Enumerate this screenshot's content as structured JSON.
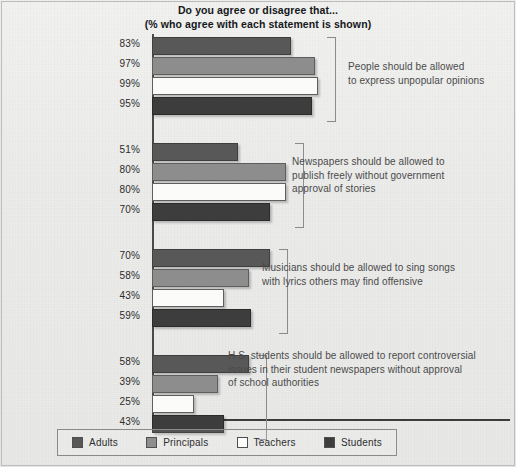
{
  "chart_data": {
    "type": "bar",
    "orientation": "horizontal",
    "title": "Do you agree or disagree that...",
    "subtitle": "(% who agree with each statement is shown)",
    "xlabel": "",
    "ylabel": "",
    "xlim": [
      0,
      100
    ],
    "grid": false,
    "legend_position": "bottom",
    "value_suffix": "%",
    "series_order": [
      "Adults",
      "Principals",
      "Teachers",
      "Students"
    ],
    "categories": [
      "People should be allowed to express unpopular opinions",
      "Newspapers should be allowed to publish freely without government approval of stories",
      "Musicians should be allowed to sing songs with lyrics others may find offensive",
      "H.S. students should be allowed to report controversial issues in their student newspapers without approval of school authorities"
    ],
    "series": [
      {
        "name": "Adults",
        "values": [
          83,
          51,
          70,
          58
        ]
      },
      {
        "name": "Principals",
        "values": [
          97,
          80,
          58,
          39
        ]
      },
      {
        "name": "Teachers",
        "values": [
          99,
          80,
          43,
          25
        ]
      },
      {
        "name": "Students",
        "values": [
          95,
          70,
          59,
          43
        ]
      }
    ],
    "groups": [
      {
        "annotation": "People should be allowed\nto express unpopular opinions",
        "bars": [
          {
            "series": "Adults",
            "value": 83,
            "label": "83%",
            "color": "#585858"
          },
          {
            "series": "Principals",
            "value": 97,
            "label": "97%",
            "color": "#8d8d8d"
          },
          {
            "series": "Teachers",
            "value": 99,
            "label": "99%",
            "color": "#fbfbf9"
          },
          {
            "series": "Students",
            "value": 95,
            "label": "95%",
            "color": "#3d3d3d"
          }
        ]
      },
      {
        "annotation": "Newspapers should be allowed to\npublish freely without government\napproval of stories",
        "bars": [
          {
            "series": "Adults",
            "value": 51,
            "label": "51%",
            "color": "#585858"
          },
          {
            "series": "Principals",
            "value": 80,
            "label": "80%",
            "color": "#8d8d8d"
          },
          {
            "series": "Teachers",
            "value": 80,
            "label": "80%",
            "color": "#fbfbf9"
          },
          {
            "series": "Students",
            "value": 70,
            "label": "70%",
            "color": "#3d3d3d"
          }
        ]
      },
      {
        "annotation": "Musicians should be allowed to sing songs\nwith lyrics others may find offensive",
        "bars": [
          {
            "series": "Adults",
            "value": 70,
            "label": "70%",
            "color": "#585858"
          },
          {
            "series": "Principals",
            "value": 58,
            "label": "58%",
            "color": "#8d8d8d"
          },
          {
            "series": "Teachers",
            "value": 43,
            "label": "43%",
            "color": "#fbfbf9"
          },
          {
            "series": "Students",
            "value": 59,
            "label": "59%",
            "color": "#3d3d3d"
          }
        ]
      },
      {
        "annotation": "H.S. students should be allowed to report controversial\nissues in their student newspapers without approval\nof school authorities",
        "bars": [
          {
            "series": "Adults",
            "value": 58,
            "label": "58%",
            "color": "#585858"
          },
          {
            "series": "Principals",
            "value": 39,
            "label": "39%",
            "color": "#8d8d8d"
          },
          {
            "series": "Teachers",
            "value": 25,
            "label": "25%",
            "color": "#fbfbf9"
          },
          {
            "series": "Students",
            "value": 43,
            "label": "43%",
            "color": "#3d3d3d"
          }
        ]
      }
    ],
    "legend": [
      {
        "label": "Adults",
        "color": "#585858",
        "key": "adults"
      },
      {
        "label": "Principals",
        "color": "#8d8d8d",
        "key": "principals"
      },
      {
        "label": "Teachers",
        "color": "#fbfbf9",
        "key": "teachers"
      },
      {
        "label": "Students",
        "color": "#3d3d3d",
        "key": "students"
      }
    ]
  }
}
